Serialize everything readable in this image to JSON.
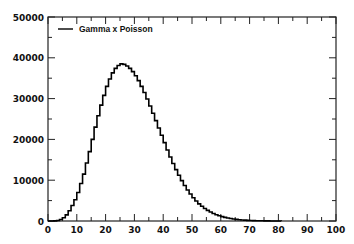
{
  "chart_data": {
    "type": "bar",
    "style": "step-histogram",
    "title": "",
    "xlabel": "",
    "ylabel": "",
    "xlim": [
      0,
      100
    ],
    "ylim": [
      0,
      50000
    ],
    "grid": false,
    "legend_position": "upper-left",
    "x_ticks": [
      "0",
      "10",
      "20",
      "30",
      "40",
      "50",
      "60",
      "70",
      "80",
      "90",
      "100"
    ],
    "y_ticks": [
      "0",
      "10000",
      "20000",
      "30000",
      "40000",
      "50000"
    ],
    "series": [
      {
        "name": "Gamma x Poisson",
        "color": "#000000",
        "bin_width": 1,
        "x": [
          0,
          1,
          2,
          3,
          4,
          5,
          6,
          7,
          8,
          9,
          10,
          11,
          12,
          13,
          14,
          15,
          16,
          17,
          18,
          19,
          20,
          21,
          22,
          23,
          24,
          25,
          26,
          27,
          28,
          29,
          30,
          31,
          32,
          33,
          34,
          35,
          36,
          37,
          38,
          39,
          40,
          41,
          42,
          43,
          44,
          45,
          46,
          47,
          48,
          49,
          50,
          51,
          52,
          53,
          54,
          55,
          56,
          57,
          58,
          59,
          60,
          61,
          62,
          63,
          64,
          65,
          66,
          67,
          68,
          69,
          70,
          71,
          72,
          73,
          74,
          75,
          76,
          77,
          78,
          79,
          80
        ],
        "values": [
          0,
          5,
          30,
          120,
          350,
          800,
          1500,
          2500,
          3800,
          5200,
          7000,
          9200,
          11500,
          14200,
          17000,
          20000,
          23000,
          25800,
          28400,
          30800,
          33000,
          34800,
          36300,
          37400,
          38100,
          38500,
          38400,
          38000,
          37400,
          36600,
          35600,
          34400,
          33000,
          31500,
          29900,
          28200,
          26400,
          24600,
          22800,
          21000,
          19200,
          17400,
          15700,
          14100,
          12600,
          11200,
          9900,
          8700,
          7600,
          6600,
          5700,
          4900,
          4200,
          3600,
          3050,
          2600,
          2200,
          1850,
          1550,
          1300,
          1080,
          890,
          730,
          600,
          490,
          395,
          320,
          255,
          205,
          160,
          125,
          98,
          75,
          58,
          44,
          33,
          25,
          18,
          13,
          9,
          6
        ]
      }
    ]
  },
  "legend": {
    "label": "Gamma x Poisson"
  }
}
